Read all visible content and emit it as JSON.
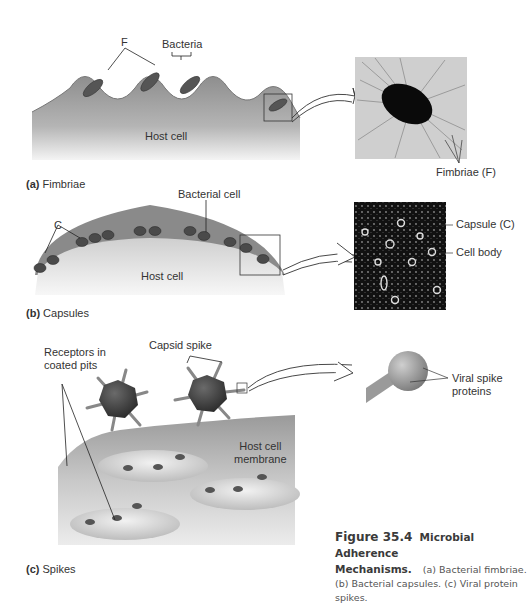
{
  "figure": {
    "number": "Figure 35.4",
    "title": "Microbial Adherence",
    "title_cont": "Mechanisms.",
    "caption_line1": "(a) Bacterial fimbriae.",
    "caption_line2": "(b) Bacterial capsules. (c) Viral protein spikes."
  },
  "panel_a": {
    "tag": "(a)",
    "name": "Fimbriae",
    "labels": {
      "fimbriae_short": "F",
      "bacteria": "Bacteria",
      "host_cell": "Host cell",
      "micrograph_label": "Fimbriae (F)"
    }
  },
  "panel_b": {
    "tag": "(b)",
    "name": "Capsules",
    "labels": {
      "capsule_short": "C",
      "bacterial_cell": "Bacterial cell",
      "host_cell": "Host cell",
      "capsule": "Capsule (C)",
      "cell_body": "Cell body"
    }
  },
  "panel_c": {
    "tag": "(c)",
    "name": "Spikes",
    "labels": {
      "receptors": "Receptors in",
      "receptors_2": "coated pits",
      "capsid_spike": "Capsid spike",
      "host_membrane": "Host cell",
      "host_membrane_2": "membrane",
      "viral_spike": "Viral spike",
      "viral_spike_2": "proteins"
    }
  }
}
